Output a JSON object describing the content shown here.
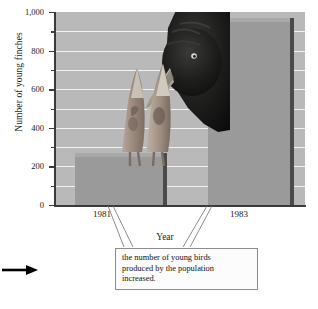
{
  "figure": {
    "name": "young-finches-bar-chart",
    "margin_arrow": "right-arrow"
  },
  "chart_data": {
    "type": "bar",
    "title": "",
    "categories": [
      "1981",
      "1983"
    ],
    "values": [
      250,
      950
    ],
    "xlabel": "Year",
    "ylabel": "Number of young finches",
    "ylim": [
      0,
      1000
    ],
    "yticks": [
      "0",
      "200",
      "400",
      "600",
      "800",
      "1,000"
    ],
    "ytick_values": [
      0,
      200,
      400,
      600,
      800,
      1000
    ],
    "minor_tick_interval": 100,
    "grid": true,
    "grid_color": "#f2f2f2",
    "plot_background": "#b9b9b9",
    "bar_color": "#9a9a9a",
    "bar_side_color": "#4a4a4a",
    "legend": "none",
    "annotations": [
      {
        "text": "the number of young birds produced by the population increased.",
        "points_to": [
          "1981",
          "1983"
        ]
      }
    ],
    "photo_overlay": "adult-finch-feeding-two-chicks"
  },
  "callout": {
    "line1": "the number of young birds",
    "line2": "produced by the population",
    "line3": "increased."
  },
  "axes": {
    "y_title": "Number of young finches",
    "x_title": "Year",
    "y_ticks": [
      "1,000",
      "800",
      "600",
      "400",
      "200",
      "0"
    ],
    "x_ticks": [
      "1981",
      "1983"
    ]
  }
}
